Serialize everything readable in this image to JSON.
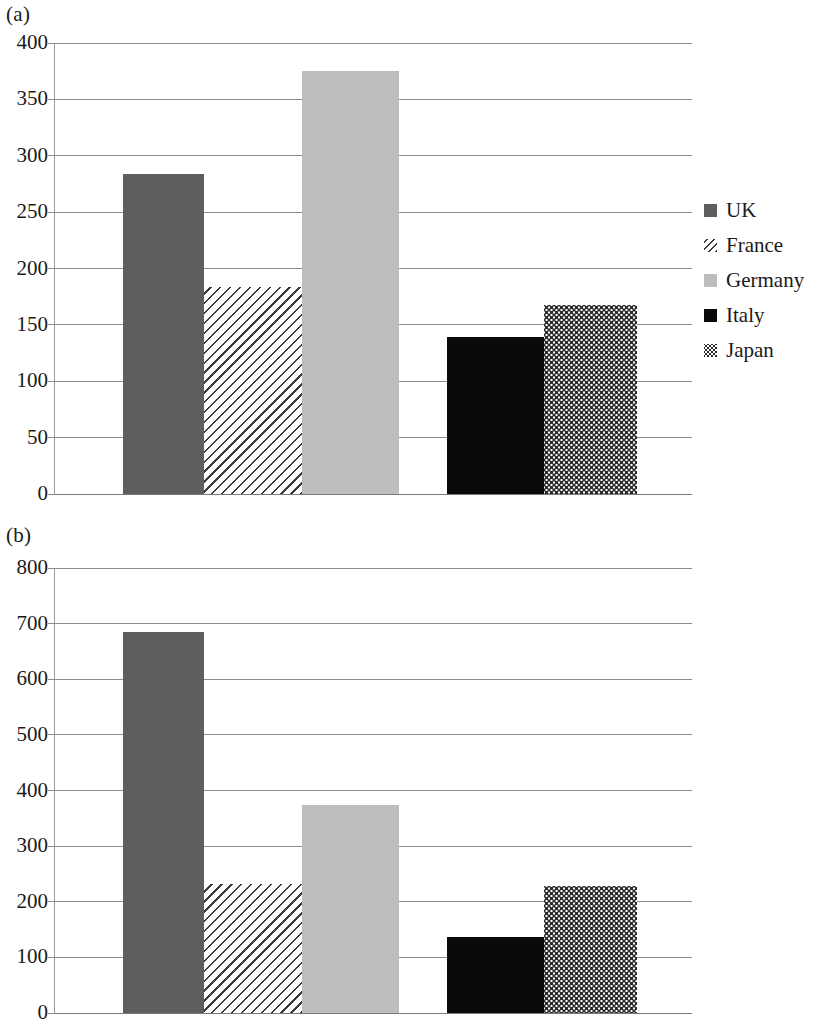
{
  "panels": [
    {
      "label": "(a)"
    },
    {
      "label": "(b)"
    }
  ],
  "chart_data": [
    {
      "type": "bar",
      "title": "(a)",
      "xlabel": "",
      "ylabel": "",
      "ylim": [
        0,
        400
      ],
      "yticks": [
        0,
        50,
        100,
        150,
        200,
        250,
        300,
        350,
        400
      ],
      "ytick_labels": [
        "0",
        "50",
        "100",
        "150",
        "200",
        "250",
        "300",
        "350",
        "400"
      ],
      "grid": true,
      "legend_position": "right",
      "categories": [
        "UK",
        "France",
        "Germany",
        "Italy",
        "Japan"
      ],
      "values": [
        284,
        184,
        375,
        139,
        168
      ],
      "legend": [
        {
          "label": "UK",
          "fill": "solid-dark",
          "color": "#5e5e5e"
        },
        {
          "label": "France",
          "fill": "hatch",
          "color": "#3a3a3a"
        },
        {
          "label": "Germany",
          "fill": "solid-light",
          "color": "#bdbdbd"
        },
        {
          "label": "Italy",
          "fill": "solid-black",
          "color": "#0a0a0a"
        },
        {
          "label": "Japan",
          "fill": "dots",
          "color": "#2b2b2b"
        }
      ]
    },
    {
      "type": "bar",
      "title": "(b)",
      "xlabel": "",
      "ylabel": "",
      "ylim": [
        0,
        800
      ],
      "yticks": [
        0,
        100,
        200,
        300,
        400,
        500,
        600,
        700,
        800
      ],
      "ytick_labels": [
        "0",
        "100",
        "200",
        "300",
        "400",
        "500",
        "600",
        "700",
        "800"
      ],
      "grid": true,
      "legend_position": "right",
      "categories": [
        "Britain",
        "France",
        "Germany",
        "Italy",
        "Japan"
      ],
      "values": [
        685,
        232,
        374,
        137,
        228
      ],
      "legend": [
        {
          "label": "Britain",
          "fill": "solid-dark",
          "color": "#5e5e5e"
        },
        {
          "label": "France",
          "fill": "hatch",
          "color": "#3a3a3a"
        },
        {
          "label": "Germany",
          "fill": "solid-light",
          "color": "#bdbdbd"
        },
        {
          "label": "Italy",
          "fill": "solid-black",
          "color": "#0a0a0a"
        },
        {
          "label": "Japan",
          "fill": "dots",
          "color": "#2b2b2b"
        }
      ]
    }
  ]
}
